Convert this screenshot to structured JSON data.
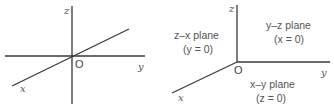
{
  "left_diagram": {
    "axes": {
      "z": "z",
      "y": "y",
      "x": "x"
    },
    "origin": "O"
  },
  "right_diagram": {
    "axes": {
      "z": "z",
      "y": "y",
      "x": "x"
    },
    "origin": "O",
    "planes": {
      "zx": {
        "name": "z–x plane",
        "eq": "(y = 0)"
      },
      "yz": {
        "name": "y–z plane",
        "eq": "(x = 0)"
      },
      "xy": {
        "name": "x–y plane",
        "eq": "(z = 0)"
      }
    }
  },
  "colors": {
    "axis": "#3a3a3a",
    "text": "#555555"
  }
}
